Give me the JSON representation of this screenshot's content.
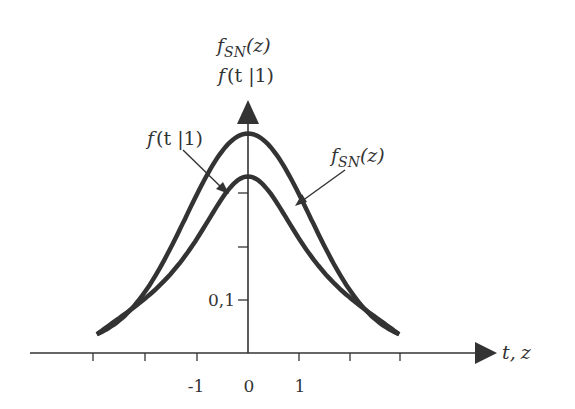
{
  "chart_data": {
    "type": "line",
    "title": "",
    "y_axis_title_line1": {
      "f": "f",
      "sub": "SN",
      "arg": "(z)"
    },
    "y_axis_title_line2": "f (t |1)",
    "xlabel": "t, z",
    "ylabel": "",
    "x_ticks": [
      -3,
      -2,
      -1,
      0,
      1,
      2,
      3
    ],
    "x_tick_labels": [
      "-1",
      "0",
      "1"
    ],
    "x_tick_label_values": [
      -1,
      0,
      1
    ],
    "y_ticks": [
      0.1,
      0.2,
      0.3
    ],
    "y_tick_labels": [
      "0,1"
    ],
    "xlim": [
      -3.5,
      3.5
    ],
    "ylim": [
      0,
      0.45
    ],
    "grid": false,
    "legend": "none (annotations with arrows)",
    "series": [
      {
        "name": "f_SN(z)",
        "label": "standard normal density",
        "peak": 0.399,
        "x": [
          -2.4,
          -2,
          -1.5,
          -1,
          -0.5,
          0,
          0.5,
          1,
          1.5,
          2,
          2.4
        ],
        "values": [
          0.022,
          0.054,
          0.13,
          0.242,
          0.352,
          0.399,
          0.352,
          0.242,
          0.13,
          0.054,
          0.022
        ]
      },
      {
        "name": "f(t|1)",
        "label": "Student t density, 1 degree of freedom",
        "peak": 0.318,
        "x": [
          -2.4,
          -2,
          -1.5,
          -1,
          -0.5,
          0,
          0.5,
          1,
          1.5,
          2,
          2.4
        ],
        "values": [
          0.047,
          0.064,
          0.098,
          0.159,
          0.255,
          0.318,
          0.255,
          0.159,
          0.098,
          0.064,
          0.047
        ]
      }
    ],
    "annotations": [
      {
        "text_f": "f",
        "text_rest": "(t |1)",
        "points_to": "f(t|1)",
        "side": "left"
      },
      {
        "text_f": "f",
        "text_sub": "SN",
        "text_rest": "(z)",
        "points_to": "f_SN(z)",
        "side": "right"
      }
    ]
  },
  "labels": {
    "ytitle1_f": "f",
    "ytitle1_sub": "SN",
    "ytitle1_arg": "(z)",
    "ytitle2_f": "f",
    "ytitle2_arg": "(t |1)",
    "ann_left_f": "f",
    "ann_left_arg": "(t |1)",
    "ann_right_f": "f",
    "ann_right_sub": "SN",
    "ann_right_arg": "(z)",
    "xaxis_t": "t,",
    "xaxis_z": "z",
    "ytick_01": "0,1",
    "xtick_m1": "-1",
    "xtick_0": "0",
    "xtick_1": "1"
  },
  "colors": {
    "curve": "#333333",
    "axis": "#333333",
    "text": "#333333",
    "background": "#ffffff"
  }
}
